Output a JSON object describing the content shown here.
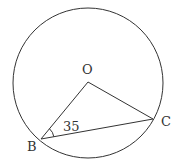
{
  "diagram": {
    "type": "circle-geometry",
    "colors": {
      "stroke": "#333333",
      "background": "#ffffff",
      "text": "#333333"
    },
    "circle": {
      "center_label": "O"
    },
    "points": [
      {
        "label": "O",
        "role": "center"
      },
      {
        "label": "B",
        "role": "on-circle"
      },
      {
        "label": "C",
        "role": "on-circle"
      }
    ],
    "segments": [
      "OB",
      "OC",
      "BC"
    ],
    "angle": {
      "vertex": "B",
      "between": [
        "OB",
        "BC"
      ],
      "value_label": "35"
    }
  }
}
